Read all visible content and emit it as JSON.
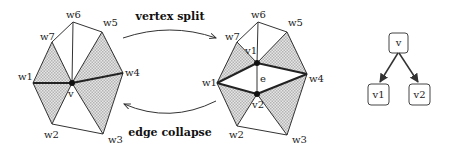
{
  "diagram": {
    "left_mesh": {
      "center_label": "v",
      "neighbors": [
        "w1",
        "w2",
        "w3",
        "w4",
        "w5",
        "w6",
        "w7"
      ]
    },
    "right_mesh": {
      "split_vertices": [
        "v1",
        "v2"
      ],
      "edge_label": "e",
      "neighbors": [
        "w1",
        "w2",
        "w3",
        "w4",
        "w5",
        "w6",
        "w7"
      ]
    },
    "operations": {
      "forward": "vertex split",
      "backward": "edge collapse"
    },
    "hierarchy": {
      "parent": "v",
      "children": [
        "v1",
        "v2"
      ]
    },
    "colors": {
      "stroke": "#333333",
      "hatch": "#bdbdbd",
      "vertex": "#111111"
    }
  }
}
